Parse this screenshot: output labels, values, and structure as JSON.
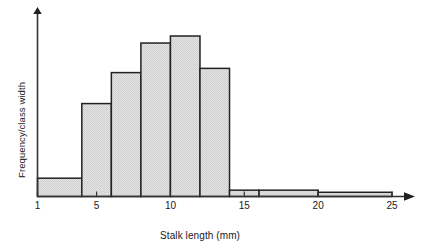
{
  "chart_data": {
    "type": "bar",
    "title": "",
    "xlabel": "Stalk length (mm)",
    "ylabel": "Frequency/class width",
    "xlim": [
      1,
      26
    ],
    "ylim": [
      0,
      12
    ],
    "grid": false,
    "legend": null,
    "xticks": [
      1,
      5,
      10,
      15,
      20,
      25
    ],
    "xtick_labels": [
      "1",
      "5",
      "10",
      "15",
      "20",
      "25"
    ],
    "yticks": [],
    "ytick_labels": [],
    "bins": [
      {
        "left": 1,
        "right": 4,
        "height": 1.3
      },
      {
        "left": 4,
        "right": 6,
        "height": 6.6
      },
      {
        "left": 6,
        "right": 8,
        "height": 8.8
      },
      {
        "left": 8,
        "right": 10,
        "height": 10.9
      },
      {
        "left": 10,
        "right": 12,
        "height": 11.4
      },
      {
        "left": 12,
        "right": 14,
        "height": 9.1
      },
      {
        "left": 14,
        "right": 16,
        "height": 0.45
      },
      {
        "left": 16,
        "right": 20,
        "height": 0.45
      },
      {
        "left": 20,
        "right": 25,
        "height": 0.3
      }
    ],
    "bar_fill_color": "#dcdcdc",
    "bar_edge_color": "#222222",
    "axis_color": "#333333"
  },
  "axes": {
    "x_title": "Stalk length (mm)",
    "y_title": "Frequency/class width"
  },
  "ticks": {
    "x": [
      {
        "label": "1",
        "value": 1
      },
      {
        "label": "5",
        "value": 5
      },
      {
        "label": "10",
        "value": 10
      },
      {
        "label": "15",
        "value": 15
      },
      {
        "label": "20",
        "value": 20
      },
      {
        "label": "25",
        "value": 25
      }
    ]
  }
}
